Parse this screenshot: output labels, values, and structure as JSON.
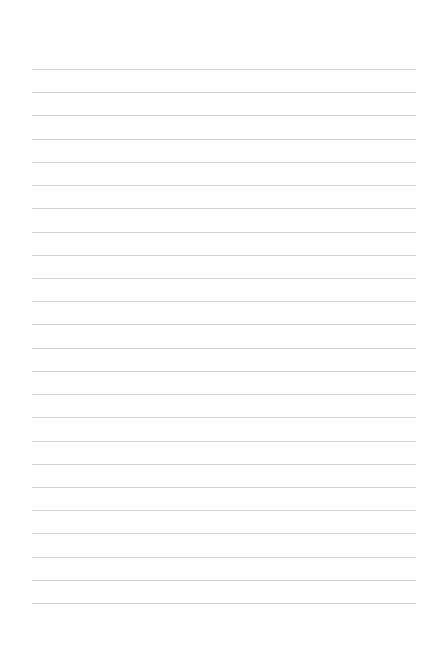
{
  "page": {
    "type": "lined-paper",
    "line_count": 24,
    "line_color": "#d2d2d2",
    "background_color": "#ffffff",
    "lines": [
      {
        "text": ""
      },
      {
        "text": ""
      },
      {
        "text": ""
      },
      {
        "text": ""
      },
      {
        "text": ""
      },
      {
        "text": ""
      },
      {
        "text": ""
      },
      {
        "text": ""
      },
      {
        "text": ""
      },
      {
        "text": ""
      },
      {
        "text": ""
      },
      {
        "text": ""
      },
      {
        "text": ""
      },
      {
        "text": ""
      },
      {
        "text": ""
      },
      {
        "text": ""
      },
      {
        "text": ""
      },
      {
        "text": ""
      },
      {
        "text": ""
      },
      {
        "text": ""
      },
      {
        "text": ""
      },
      {
        "text": ""
      },
      {
        "text": ""
      },
      {
        "text": ""
      }
    ]
  }
}
